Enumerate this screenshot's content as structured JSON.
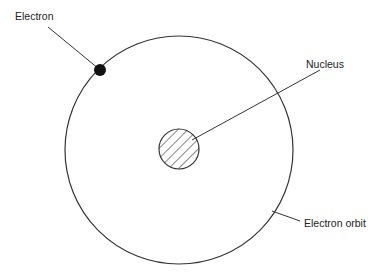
{
  "diagram": {
    "labels": {
      "electron": "Electron",
      "nucleus": "Nucleus",
      "orbit": "Electron orbit"
    },
    "colors": {
      "line": "#333333",
      "electron_fill": "#111111",
      "background": "#ffffff"
    }
  }
}
